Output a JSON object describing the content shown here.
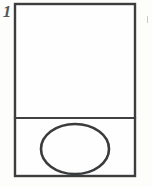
{
  "figure": {
    "label": "1",
    "caption": "",
    "kind": "technical-line-drawing",
    "background_color": "#fdfdfc",
    "ink_color": "#3c3d3e"
  },
  "drawing": {
    "outer_rectangle": {
      "name": "container-outline",
      "x": 15,
      "y": 4,
      "width": 120,
      "height": 172,
      "stroke_width": 2.4
    },
    "divider_line": {
      "name": "horizontal-partition",
      "x1": 15,
      "y1": 118,
      "x2": 135,
      "y2": 118,
      "stroke_width": 2.2
    },
    "upper_compartment": {
      "name": "upper-panel",
      "x": 15,
      "y": 4,
      "width": 120,
      "height": 114,
      "contents": "empty"
    },
    "lower_compartment": {
      "name": "lower-panel",
      "x": 15,
      "y": 118,
      "width": 120,
      "height": 58,
      "contents": "ellipse"
    },
    "ellipse": {
      "name": "oval-element",
      "cx": 75,
      "cy": 149,
      "rx": 34,
      "ry": 25,
      "stroke_width": 2.6,
      "fill": "none"
    },
    "edge_speck": {
      "name": "scan-artifact",
      "x": 147,
      "y": 16,
      "width": 1,
      "height": 7
    }
  }
}
